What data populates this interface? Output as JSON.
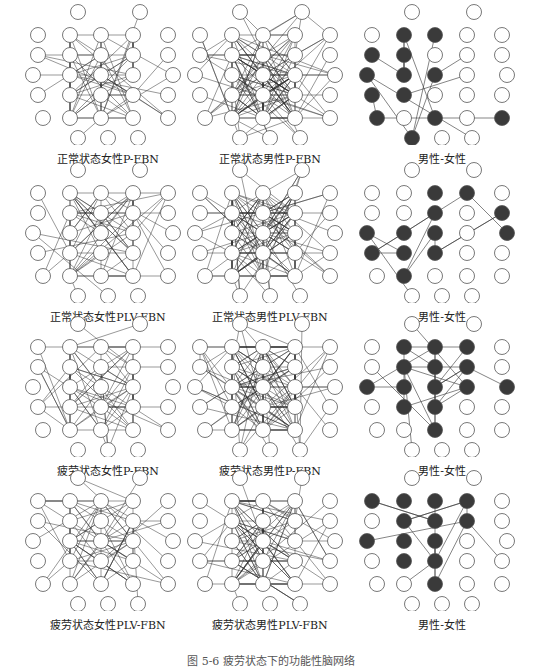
{
  "figure": {
    "caption": "图 5-6 疲劳状态下的功能性脑网络",
    "node_style": {
      "stroke": "#555555",
      "fill_empty": "#ffffff",
      "fill_diff": "#3a3a3a",
      "edge": "#333333"
    },
    "columns": [
      "female",
      "male",
      "male-female"
    ],
    "rows": [
      {
        "panels": [
          {
            "label": "正常状态女性P-FBN",
            "density": "medium",
            "type": "network"
          },
          {
            "label": "正常状态男性P-FBN",
            "density": "high",
            "type": "network"
          },
          {
            "label": "男性-女性",
            "density": "low",
            "type": "difference",
            "filled_nodes": [
              3,
              4,
              7,
              8,
              12,
              13,
              14,
              17,
              18,
              22,
              24,
              26,
              27
            ]
          }
        ]
      },
      {
        "panels": [
          {
            "label": "正常状态女性PLV-FBN",
            "density": "medium",
            "type": "network"
          },
          {
            "label": "正常状态男性PLV-FBN",
            "density": "high",
            "type": "network"
          },
          {
            "label": "男性-女性",
            "density": "low",
            "type": "difference",
            "filled_nodes": [
              4,
              5,
              9,
              11,
              12,
              13,
              14,
              16,
              17,
              18,
              19,
              23
            ]
          }
        ]
      },
      {
        "panels": [
          {
            "label": "疲劳状态女性P-FBN",
            "density": "medium",
            "type": "network"
          },
          {
            "label": "疲劳状态男性P-FBN",
            "density": "high",
            "type": "network"
          },
          {
            "label": "男性-女性",
            "density": "medium-low",
            "type": "difference",
            "filled_nodes": [
              3,
              4,
              5,
              8,
              9,
              10,
              12,
              13,
              14,
              15,
              16,
              18,
              19,
              24
            ]
          }
        ]
      },
      {
        "panels": [
          {
            "label": "疲劳状态女性PLV-FBN",
            "density": "medium",
            "type": "network"
          },
          {
            "label": "疲劳状态男性PLV-FBN",
            "density": "medium-high",
            "type": "network"
          },
          {
            "label": "男性-女性",
            "density": "low",
            "type": "difference",
            "filled_nodes": [
              2,
              3,
              4,
              5,
              8,
              9,
              10,
              12,
              13,
              14,
              18,
              19,
              24
            ]
          }
        ]
      }
    ]
  }
}
